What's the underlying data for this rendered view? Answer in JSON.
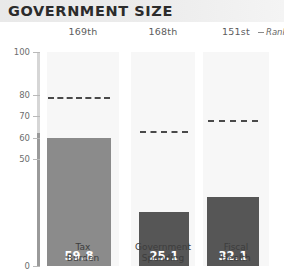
{
  "header": {
    "title": "GOVERNMENT SIZE"
  },
  "legend": {
    "rank_label": "Rank",
    "dash_icon": "dashed-line-icon"
  },
  "chart_data": {
    "type": "bar",
    "title": "GOVERNMENT SIZE",
    "xlabel": "",
    "ylabel": "",
    "ylim": [
      0,
      100
    ],
    "grid": false,
    "legend_position": "top-right",
    "categories": [
      "Tax Burden",
      "Government Spending",
      "Fiscal Health"
    ],
    "category_lines": [
      [
        "Tax",
        "Burden"
      ],
      [
        "Government",
        "Spending"
      ],
      [
        "Fiscal",
        "Health"
      ]
    ],
    "values": [
      59.8,
      25.1,
      32.1
    ],
    "value_labels": [
      "59.8",
      "25.1",
      "32.1"
    ],
    "ranks": [
      "169th",
      "168th",
      "151st"
    ],
    "reference_lines": [
      79.0,
      63.0,
      68.0
    ],
    "ytick_labels": [
      "100",
      "80",
      "70",
      "60",
      "50",
      "0"
    ],
    "yticks": [
      100,
      80,
      70,
      60,
      50,
      0
    ],
    "series": [
      {
        "name": "Score",
        "values": [
          59.8,
          25.1,
          32.1
        ]
      },
      {
        "name": "World Average",
        "values": [
          79.0,
          63.0,
          68.0
        ]
      }
    ],
    "bar_colors": [
      "#8b8b8b",
      "#565656",
      "#565656"
    ],
    "reference_line_color": "#4a4a4a",
    "column_band_color": "#f7f7f7"
  }
}
